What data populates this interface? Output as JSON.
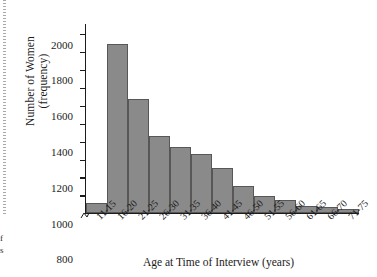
{
  "page": {
    "margin_crop_line1": "f",
    "margin_crop_line2": "s"
  },
  "chart_data": {
    "type": "bar",
    "title": "",
    "xlabel": "Age at Time of Interview (years)",
    "ylabel_line1": "Number of Women",
    "ylabel_line2": "(frequency)",
    "categories": [
      "11-15",
      "16-20",
      "21-25",
      "26-30",
      "31-35",
      "36-40",
      "41-45",
      "46-50",
      "51-55",
      "56-60",
      "61-65",
      "66-70",
      "71-75"
    ],
    "values": [
      105,
      1880,
      1270,
      860,
      735,
      660,
      495,
      300,
      190,
      140,
      75,
      65,
      45
    ],
    "ytick_labels": [
      "2000",
      "1800",
      "1600",
      "1400",
      "1200",
      "1000",
      "800",
      "600",
      "400",
      "200"
    ],
    "ytick_values": [
      2000,
      1800,
      1600,
      1400,
      1200,
      1000,
      800,
      600,
      400,
      200
    ],
    "ylim": [
      0,
      2100
    ],
    "grid": false,
    "legend": "none",
    "axis_break": true,
    "bar_color": "#8a8a8a",
    "bar_edge_color": "#575757",
    "axis_color": "#1b1b1b"
  }
}
